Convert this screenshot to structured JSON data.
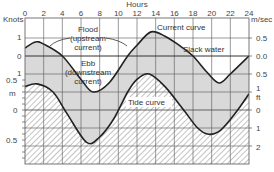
{
  "chart_data": {
    "type": "line",
    "title": "",
    "xlabel": "Hours",
    "x_ticks": [
      0,
      2,
      4,
      6,
      8,
      10,
      12,
      14,
      16,
      18,
      20,
      22,
      24
    ],
    "xlim": [
      0,
      24
    ],
    "left_axis": {
      "upper_unit": "Knots",
      "upper_ticks": [
        "1",
        "0",
        "1"
      ],
      "lower_unit": "m",
      "lower_ticks": [
        "0.5",
        "0",
        "0.5"
      ]
    },
    "right_axis": {
      "upper_unit": "m/sec",
      "upper_ticks": [
        "0.5",
        "0.0",
        "0.5"
      ],
      "lower_unit": "ft",
      "lower_ticks": [
        "1",
        "0",
        "1",
        "2"
      ]
    },
    "series": [
      {
        "name": "Current curve",
        "unit": "m/sec",
        "x": [
          0,
          1.1,
          2,
          4,
          6,
          7.3,
          9,
          11,
          12,
          13.5,
          15,
          16.5,
          18,
          19.5,
          20.8,
          22,
          24
        ],
        "values": [
          0.22,
          0.39,
          0.33,
          0.0,
          -0.65,
          -1.0,
          -0.75,
          0.0,
          0.3,
          0.67,
          0.55,
          0.3,
          0.0,
          -0.45,
          -0.75,
          -0.5,
          0.0
        ]
      },
      {
        "name": "Tide curve",
        "unit": "ft",
        "x": [
          0,
          1.3,
          3,
          4.5,
          6.6,
          8,
          9.5,
          11,
          12,
          13.3,
          15,
          17,
          18.5,
          19.7,
          21,
          22.5,
          24
        ],
        "values": [
          1.3,
          1.45,
          1.0,
          -0.2,
          -1.8,
          -1.5,
          -0.5,
          1.0,
          1.7,
          2.0,
          1.3,
          0.0,
          -1.0,
          -1.35,
          -1.1,
          -0.2,
          0.9
        ]
      }
    ],
    "annotations": [
      {
        "text": "Flood (upstream current)",
        "lines": [
          "Flood",
          "(upstream",
          "current)"
        ]
      },
      {
        "text": "Ebb (downstream current)",
        "lines": [
          "Ebb",
          "(downstream",
          "current)"
        ]
      },
      {
        "text": "Current curve"
      },
      {
        "text": "Slack water"
      },
      {
        "text": "Tide curve"
      }
    ],
    "grid": true,
    "legend": "none"
  },
  "labels": {
    "hours": "Hours",
    "knots": "Knots",
    "msec": "m/sec",
    "m": "m",
    "ft": "ft",
    "flood_1": "Flood",
    "flood_2": "(upstream",
    "flood_3": "current)",
    "ebb_1": "Ebb",
    "ebb_2": "(downstream",
    "ebb_3": "current)",
    "current_curve": "Current curve",
    "slack_water": "Slack water",
    "tide_curve": "Tide curve",
    "hour_ticks": [
      "0",
      "2",
      "4",
      "6",
      "8",
      "10",
      "12",
      "14",
      "16",
      "18",
      "20",
      "22",
      "24"
    ],
    "knot_ticks": [
      "1",
      "0",
      "1"
    ],
    "m_ticks": [
      "0.5",
      "0",
      "0.5"
    ],
    "msec_ticks": [
      "0.5",
      "0.0",
      "0.5"
    ],
    "ft_ticks": [
      "1",
      "0",
      "1",
      "2"
    ]
  }
}
